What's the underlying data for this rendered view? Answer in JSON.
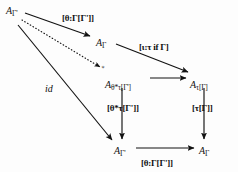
{
  "diagram": {
    "canvas": {
      "width": 238,
      "height": 172
    },
    "ink_color": "#121212",
    "background_color": "#fdfdfd",
    "nodes": [
      {
        "id": "A-gamma-prime-top",
        "name": "node-a-gamma-prime-top",
        "base": "A",
        "subscript": "Γ'",
        "x": 6,
        "y": 6
      },
      {
        "id": "A-gamma-top",
        "name": "node-a-gamma-top",
        "base": "A",
        "subscript": "Γ",
        "x": 96,
        "y": 38
      },
      {
        "id": "A-theta-star-tau-gamma-prime",
        "name": "node-a-theta-star-tau-gamma-prime",
        "base": "A",
        "subscript": "θ*τ[Γ']",
        "x": 105,
        "y": 80
      },
      {
        "id": "A-tau-gamma",
        "name": "node-a-tau-gamma",
        "base": "A",
        "subscript": "τ[Γ]",
        "x": 190,
        "y": 80
      },
      {
        "id": "A-gamma-prime-bottom",
        "name": "node-a-gamma-prime-bottom",
        "base": "A",
        "subscript": "Γ'",
        "x": 114,
        "y": 146
      },
      {
        "id": "A-gamma-bottom",
        "name": "node-a-gamma-bottom",
        "base": "A",
        "subscript": "Γ",
        "x": 199,
        "y": 146
      }
    ],
    "edges": [
      {
        "id": "edge-top-theta",
        "name": "arrow-top-theta-substitution",
        "style": "solid",
        "from": "A-gamma-prime-top",
        "to": "A-gamma-top",
        "label": "[θ:Γ[Γ']]",
        "label_x": 62,
        "label_y": 14
      },
      {
        "id": "edge-dotted",
        "name": "arrow-dotted-diagonal",
        "style": "dotted",
        "from": "A-gamma-prime-top",
        "to": "A-theta-star-tau-gamma-prime",
        "label": "∗",
        "label_x": 101,
        "label_y": 64
      },
      {
        "id": "edge-id",
        "name": "arrow-identity",
        "style": "solid",
        "from": "A-gamma-prime-top",
        "to": "A-gamma-prime-bottom",
        "label": "id",
        "label_x": 45,
        "label_y": 84
      },
      {
        "id": "edge-tau-iota",
        "name": "arrow-tau-type-formation",
        "style": "solid",
        "from": "A-gamma-top",
        "to": "A-tau-gamma",
        "label": "[ι:τ if Γ]",
        "label_x": 139,
        "label_y": 43
      },
      {
        "id": "edge-middle-horizontal",
        "name": "arrow-middle-horizontal",
        "style": "solid",
        "from": "A-theta-star-tau-gamma-prime",
        "to": "A-tau-gamma",
        "label": "",
        "label_x": 0,
        "label_y": 0
      },
      {
        "id": "edge-left-vertical",
        "name": "arrow-left-vertical-theta-star-tau",
        "style": "solid",
        "from": "A-theta-star-tau-gamma-prime",
        "to": "A-gamma-prime-bottom",
        "label": "[θ*τ[Γ']]",
        "label_x": 107,
        "label_y": 104
      },
      {
        "id": "edge-right-vertical",
        "name": "arrow-right-vertical-tau",
        "style": "solid",
        "from": "A-tau-gamma",
        "to": "A-gamma-bottom",
        "label": "[τ[Γ]]",
        "label_x": 192,
        "label_y": 104
      },
      {
        "id": "edge-bottom-theta",
        "name": "arrow-bottom-theta-substitution",
        "style": "solid",
        "from": "A-gamma-prime-bottom",
        "to": "A-gamma-bottom",
        "label": "[θ:Γ[Γ']]",
        "label_x": 141,
        "label_y": 159
      }
    ]
  }
}
